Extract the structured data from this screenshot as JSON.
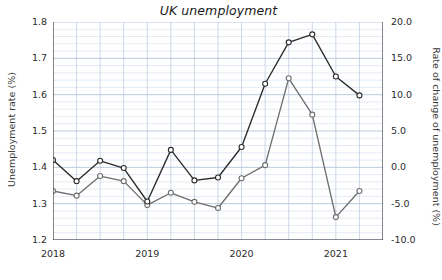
{
  "chart_data": {
    "type": "line",
    "title": "UK unemployment",
    "xlabel": "",
    "ylabel": "Unemployment rate (%)",
    "y2label": "Rate of change of unemployment (%)",
    "grid": true,
    "legend": "none",
    "xlim": [
      2018.0,
      2021.5
    ],
    "ylim": [
      1.2,
      1.8
    ],
    "y2lim": [
      -10.0,
      20.0
    ],
    "x": [
      2018.0,
      2018.25,
      2018.5,
      2018.75,
      2019.0,
      2019.25,
      2019.5,
      2019.75,
      2020.0,
      2020.25,
      2020.5,
      2020.75,
      2021.0,
      2021.25
    ],
    "xticks": [
      2018,
      2019,
      2020,
      2021
    ],
    "xticklabels": [
      "2018",
      "2019",
      "2020",
      "2021"
    ],
    "yticks": [
      1.2,
      1.3,
      1.4,
      1.5,
      1.6,
      1.7,
      1.8
    ],
    "yticklabels": [
      "1.2",
      "1.3",
      "1.4",
      "1.5",
      "1.6",
      "1.7",
      "1.8"
    ],
    "y2ticks": [
      -10.0,
      -5.0,
      0.0,
      5.0,
      10.0,
      15.0,
      20.0
    ],
    "y2ticklabels": [
      "-10.0",
      "-5.0",
      "0.0",
      "5.0",
      "10.0",
      "15.0",
      "20.0"
    ],
    "series": [
      {
        "name": "Unemployment rate",
        "axis": "left",
        "color": "#6e6e6e",
        "marker": "circle",
        "values": [
          1.335,
          1.322,
          1.376,
          1.362,
          1.296,
          1.33,
          1.305,
          1.288,
          1.37,
          1.406,
          1.645,
          1.545,
          1.263,
          1.335
        ]
      },
      {
        "name": "Rate of change of unemployment",
        "axis": "right",
        "color": "#2a2a2a",
        "marker": "circle",
        "values": [
          1.0,
          -1.9,
          0.9,
          -0.1,
          -4.7,
          2.4,
          -1.8,
          -1.4,
          2.8,
          11.5,
          17.2,
          18.3,
          12.5,
          9.9
        ]
      }
    ]
  }
}
